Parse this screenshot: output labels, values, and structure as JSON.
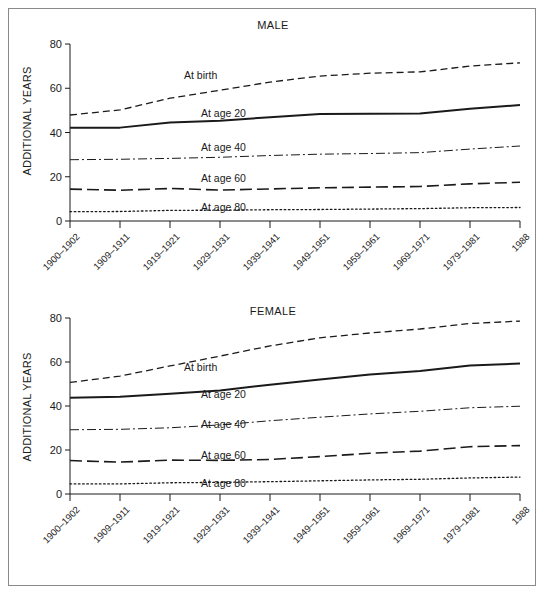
{
  "figure": {
    "border_color": "#8a8a8a",
    "background": "#ffffff",
    "ink_color": "#1a1a1a"
  },
  "panels": [
    {
      "id": "male",
      "title": "MALE",
      "ylabel": "ADDITIONAL YEARS"
    },
    {
      "id": "female",
      "title": "FEMALE",
      "ylabel": "ADDITIONAL YEARS"
    }
  ],
  "axis": {
    "yticks": [
      "0",
      "20",
      "40",
      "60",
      "80"
    ],
    "ytick_values": [
      0,
      20,
      40,
      60,
      80
    ],
    "ylim": [
      0,
      80
    ],
    "xticklabels": [
      "1900–1902",
      "1909–1911",
      "1919–1921",
      "1929–1931",
      "1939–1941",
      "1949–1951",
      "1959–1961",
      "1969–1971",
      "1979–1981",
      "1988"
    ]
  },
  "series_labels": {
    "birth": "At birth",
    "age20": "At age 20",
    "age40": "At age 40",
    "age60": "At age 60",
    "age80": "At age 80"
  },
  "chart_data": [
    {
      "type": "line",
      "title": "MALE",
      "xlabel": "",
      "ylabel": "ADDITIONAL YEARS",
      "ylim": [
        0,
        80
      ],
      "grid": false,
      "legend": "inline-labels",
      "categories": [
        "1900–1902",
        "1909–1911",
        "1919–1921",
        "1929–1931",
        "1939–1941",
        "1949–1951",
        "1959–1961",
        "1969–1971",
        "1979–1981",
        "1988"
      ],
      "series": [
        {
          "name": "At birth",
          "dash": "dashed",
          "width": 1.3,
          "values": [
            47.9,
            50.2,
            55.5,
            59.1,
            62.8,
            65.5,
            66.8,
            67.4,
            70.0,
            71.5
          ]
        },
        {
          "name": "At age 20",
          "dash": "solid",
          "width": 2.0,
          "values": [
            42.2,
            42.2,
            44.5,
            45.3,
            46.9,
            48.4,
            48.5,
            48.6,
            50.7,
            52.4
          ]
        },
        {
          "name": "At age 40",
          "dash": "dashdot",
          "width": 1.0,
          "values": [
            27.7,
            27.9,
            28.3,
            28.8,
            29.6,
            30.2,
            30.5,
            30.9,
            32.5,
            33.9
          ]
        },
        {
          "name": "At age 60",
          "dash": "longdash",
          "width": 1.6,
          "values": [
            14.4,
            13.9,
            14.7,
            14.0,
            14.5,
            15.0,
            15.3,
            15.6,
            16.8,
            17.5
          ]
        },
        {
          "name": "At age 80",
          "dash": "dotted",
          "width": 1.3,
          "values": [
            4.2,
            4.3,
            4.8,
            4.9,
            5.1,
            5.2,
            5.4,
            5.6,
            6.0,
            6.1
          ]
        }
      ]
    },
    {
      "type": "line",
      "title": "FEMALE",
      "xlabel": "",
      "ylabel": "ADDITIONAL YEARS",
      "ylim": [
        0,
        80
      ],
      "grid": false,
      "legend": "inline-labels",
      "categories": [
        "1900–1902",
        "1909–1911",
        "1919–1921",
        "1929–1931",
        "1939–1941",
        "1949–1951",
        "1959–1961",
        "1969–1971",
        "1979–1981",
        "1988"
      ],
      "series": [
        {
          "name": "At birth",
          "dash": "dashed",
          "width": 1.3,
          "values": [
            50.7,
            53.6,
            58.2,
            62.7,
            67.3,
            71.0,
            73.2,
            75.0,
            77.5,
            78.6
          ]
        },
        {
          "name": "At age 20",
          "dash": "solid",
          "width": 2.0,
          "values": [
            43.8,
            44.2,
            45.6,
            47.0,
            49.7,
            52.0,
            54.3,
            55.9,
            58.4,
            59.3
          ]
        },
        {
          "name": "At age 40",
          "dash": "dashdot",
          "width": 1.0,
          "values": [
            29.2,
            29.4,
            30.1,
            31.4,
            33.3,
            34.9,
            36.4,
            37.6,
            39.2,
            39.9
          ]
        },
        {
          "name": "At age 60",
          "dash": "longdash",
          "width": 1.6,
          "values": [
            15.2,
            14.5,
            15.4,
            15.3,
            15.7,
            17.0,
            18.5,
            19.5,
            21.5,
            22.0
          ]
        },
        {
          "name": "At age 80",
          "dash": "dotted",
          "width": 1.3,
          "values": [
            4.6,
            4.6,
            5.1,
            5.3,
            5.6,
            6.0,
            6.4,
            6.7,
            7.3,
            7.7
          ]
        }
      ]
    }
  ],
  "series_label_positions": {
    "male": {
      "birth": [
        175,
        60
      ],
      "age20": [
        192,
        98
      ],
      "age40": [
        192,
        132
      ],
      "age60": [
        192,
        163
      ],
      "age80": [
        192,
        192
      ]
    },
    "female": {
      "birth": [
        175,
        352
      ],
      "age20": [
        192,
        379
      ],
      "age40": [
        192,
        409
      ],
      "age60": [
        192,
        440
      ],
      "age80": [
        192,
        468
      ]
    }
  }
}
